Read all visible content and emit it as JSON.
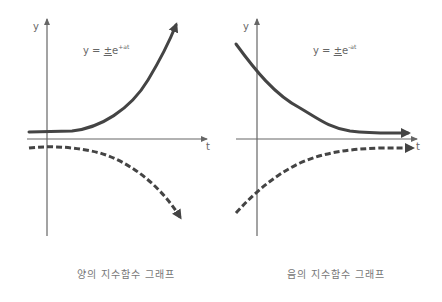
{
  "panels": [
    {
      "id": "positive",
      "axis_y_label": "y",
      "axis_x_label": "t",
      "equation": {
        "lhs": "y = ",
        "pm": "±",
        "base": "e",
        "exponent": "+at"
      },
      "caption": "양의 지수함수 그래프",
      "curves": [
        {
          "name": "+e^{+at}",
          "style": "solid",
          "direction": "rising"
        },
        {
          "name": "-e^{+at}",
          "style": "dashed",
          "direction": "falling"
        }
      ]
    },
    {
      "id": "negative",
      "axis_y_label": "y",
      "axis_x_label": "t",
      "equation": {
        "lhs": "y = ",
        "pm": "±",
        "base": "e",
        "exponent": "-at"
      },
      "caption": "음의 지수함수 그래프",
      "curves": [
        {
          "name": "+e^{-at}",
          "style": "solid",
          "direction": "decaying toward 0"
        },
        {
          "name": "-e^{-at}",
          "style": "dashed",
          "direction": "rising toward 0"
        }
      ]
    }
  ],
  "colors": {
    "axis": "#666666",
    "curve": "#444444",
    "text": "#666666"
  }
}
